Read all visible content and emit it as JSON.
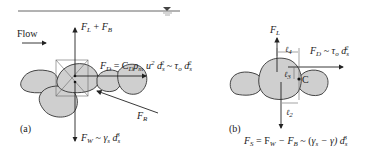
{
  "panel_a": {
    "tag": "(a)",
    "flow_label": "Flow",
    "lift_buoyancy": {
      "F": "F",
      "L": "L",
      "plus": " + ",
      "F2": "F",
      "B": "B"
    },
    "drag": {
      "F": "F",
      "D": "D",
      "eq": " = C",
      "Dsub": "D",
      "rho": "ρ",
      "m": "m",
      "u": " u",
      "u_exp": "2",
      "d": " d",
      "s": "s",
      "d_exp": "2",
      "approx": " ~ ",
      "tau": "τ",
      "o": "o",
      "d2": " d",
      "s2": "s",
      "d2_exp": "2"
    },
    "reaction": {
      "F": "F",
      "R": "R"
    },
    "weight": {
      "F": "F",
      "W": "W",
      "approx": " ~ ",
      "gamma": "γ",
      "s": "s",
      "d": " d",
      "s2": "s",
      "exp": "3"
    }
  },
  "panel_b": {
    "tag": "(b)",
    "lift": {
      "F": "F",
      "L": "L"
    },
    "drag": {
      "F": "F",
      "D": "D",
      "approx": " ~ ",
      "tau": "τ",
      "o": "o",
      "d": " d",
      "s": "s",
      "exp": "2"
    },
    "l4": {
      "l": "ℓ",
      "n": "4"
    },
    "l3": {
      "l": "ℓ",
      "n": "3"
    },
    "l2": {
      "l": "ℓ",
      "n": "2"
    },
    "pivot": "C",
    "submerged": {
      "F": "F",
      "S": "S",
      "eq": " = F",
      "W": "W",
      "minus": " − F",
      "B": "B",
      "approx": " ~ (",
      "gs": "γ",
      "s": "s",
      "minus2": " − γ) d",
      "s2": "s",
      "exp": "3"
    }
  },
  "colors": {
    "rock_fill": "#cfcfcf",
    "stroke": "#222222"
  }
}
